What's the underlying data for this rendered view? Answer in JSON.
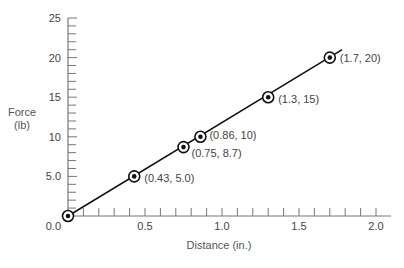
{
  "chart_data": {
    "type": "line",
    "title": "",
    "xlabel": "Distance",
    "xlabel_unit": "(in.)",
    "ylabel": "Force",
    "ylabel_unit": "(lb)",
    "xlim": [
      0,
      2.0
    ],
    "ylim": [
      0,
      25
    ],
    "x_ticks": [
      "0.0",
      "0.5",
      "1.0",
      "1.5",
      "2.0"
    ],
    "x_tick_values": [
      0,
      0.5,
      1.0,
      1.5,
      2.0
    ],
    "x_minor_step": 0.1,
    "y_ticks": [
      "5.0",
      "10",
      "15",
      "20",
      "25"
    ],
    "y_tick_values": [
      5,
      10,
      15,
      20,
      25
    ],
    "y_minor_step": 1,
    "grid": false,
    "legend": null,
    "series": [
      {
        "name": "Force vs Distance",
        "points": [
          {
            "x": 0.0,
            "y": 0.0,
            "label": ""
          },
          {
            "x": 0.43,
            "y": 5.0,
            "label": "(0.43, 5.0)"
          },
          {
            "x": 0.75,
            "y": 8.7,
            "label": "(0.75, 8.7)"
          },
          {
            "x": 0.86,
            "y": 10,
            "label": "(0.86, 10)"
          },
          {
            "x": 1.3,
            "y": 15,
            "label": "(1.3, 15)"
          },
          {
            "x": 1.7,
            "y": 20,
            "label": "(1.7, 20)"
          }
        ],
        "fit_line": {
          "x_start": 0.0,
          "y_start": 0.0,
          "x_end": 1.78,
          "y_end": 21.0
        }
      }
    ]
  },
  "labels": {
    "origin": "0.0",
    "x_title": "Distance (in.)",
    "y_title_line1": "Force",
    "y_title_line2": "(lb)"
  }
}
